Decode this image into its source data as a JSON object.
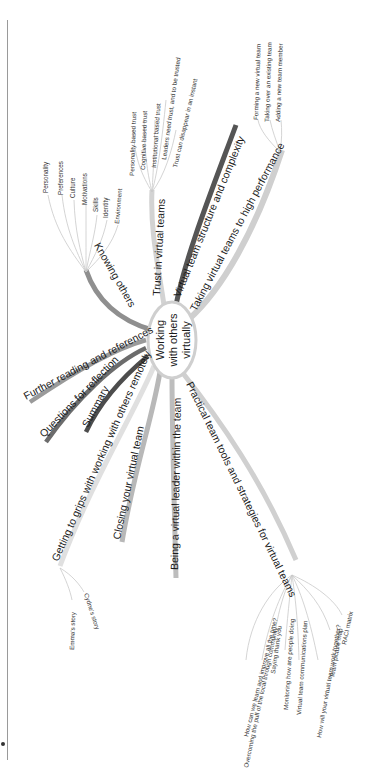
{
  "mindmap": {
    "center": {
      "lines": [
        "Working",
        "with others",
        "virtually"
      ]
    },
    "branches": {
      "trust": {
        "label": "Trust in virtual teams",
        "children": [
          "Personality based trust",
          "Cognitive based trust",
          "Institutional based trust",
          "Leaders need trust, and to be trusted",
          "Trust can disappear in an instant"
        ]
      },
      "structure": {
        "label": "Virtual team structure and complexity"
      },
      "performance": {
        "label": "Taking virtual teams to high performance",
        "children": [
          "Forming a new virtual team",
          "Taking over an existing team",
          "Adding a new team member"
        ]
      },
      "knowing": {
        "label": "Knowing others",
        "children": [
          "Personality",
          "Preferences",
          "Culture",
          "Motivations",
          "Skills",
          "Identity",
          "Environment"
        ]
      },
      "further": {
        "label": "Further reading and references"
      },
      "questions": {
        "label": "Questions for reflection"
      },
      "summary": {
        "label": "Summary"
      },
      "grips": {
        "label": "Getting to grips with working with others remotely",
        "children": [
          "Emma's story",
          "Cydne's story"
        ]
      },
      "closing": {
        "label": "Closing your virtual team"
      },
      "leader": {
        "label": "Being a virtual leader within the team"
      },
      "practical": {
        "label": "Practical team tools and strategies for virtual teams",
        "children": [
          "How can we learn and improve all the time?",
          "Overcoming the pull of the local through community",
          "Saying thank you",
          "Monitoring how are people doing",
          "Virtual team communications plan",
          "How will your virtual team work together?",
          "Team picture map",
          "RACI matrix"
        ]
      }
    },
    "colors": {
      "dark": "#555555",
      "mid": "#8a8a8a",
      "light": "#c4c4c4",
      "lighter": "#d6d6d6",
      "twig": "#c9c9c9",
      "center_fill": "#ffffff",
      "center_stroke": "#cfcfcf"
    }
  }
}
